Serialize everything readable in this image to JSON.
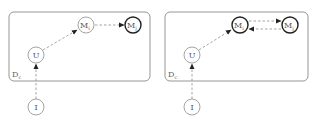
{
  "panels": [
    {
      "id": "left",
      "plate": {
        "label": "D",
        "subscript": "c"
      },
      "nodes": {
        "I": {
          "label": "I",
          "subscript": ""
        },
        "U": {
          "label": "U",
          "subscript": ""
        },
        "Mi": {
          "label": "M",
          "subscript": "i",
          "highlighted": false
        },
        "Mj": {
          "label": "M",
          "subscript": "j",
          "highlighted": true
        }
      },
      "edges": [
        {
          "from": "I",
          "to": "U",
          "style": "dashed"
        },
        {
          "from": "U",
          "to": "Mi",
          "style": "dashed"
        },
        {
          "from": "Mi",
          "to": "Mj",
          "style": "dashed"
        }
      ]
    },
    {
      "id": "right",
      "plate": {
        "label": "D",
        "subscript": "c"
      },
      "nodes": {
        "I": {
          "label": "I",
          "subscript": ""
        },
        "U": {
          "label": "U",
          "subscript": ""
        },
        "Mi": {
          "label": "M",
          "subscript": "i",
          "highlighted": true
        },
        "Mj": {
          "label": "M",
          "subscript": "j",
          "highlighted": true
        }
      },
      "edges": [
        {
          "from": "I",
          "to": "U",
          "style": "dashed"
        },
        {
          "from": "U",
          "to": "Mi",
          "style": "dashed"
        },
        {
          "from": "Mi",
          "to": "Mj",
          "style": "dashed"
        },
        {
          "from": "Mj",
          "to": "Mi",
          "style": "dashed"
        }
      ]
    }
  ],
  "colors": {
    "node_stroke": "#9a9a9a",
    "highlight_stroke": "#222222",
    "edge": "#9a9a9a",
    "plate": "#8a8a8a"
  }
}
